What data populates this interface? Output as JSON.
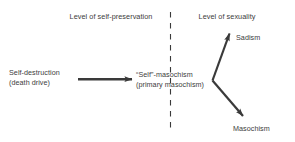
{
  "diagram": {
    "background_color": "#ffffff",
    "ink_color": "#3a3a3a",
    "headers": {
      "left": "Level of self-preservation",
      "right": "Level of sexuality"
    },
    "divider": {
      "name": "vertical-dashed-divider",
      "style": "dashed",
      "orientation": "vertical"
    },
    "nodes": {
      "source": {
        "line1": "Self-destruction",
        "line2": "(death drive)"
      },
      "middle": {
        "line1": "“Self”-masochism",
        "line2": "(primary masochism)"
      },
      "outcome_upper": "Sadism",
      "outcome_lower": "Masochism"
    },
    "arrows": [
      {
        "name": "arrow-self-destruction-to-self-masochism",
        "direction": "right"
      },
      {
        "name": "arrow-branch-to-sadism",
        "direction": "up-right"
      },
      {
        "name": "arrow-branch-to-masochism",
        "direction": "down-right"
      }
    ]
  }
}
